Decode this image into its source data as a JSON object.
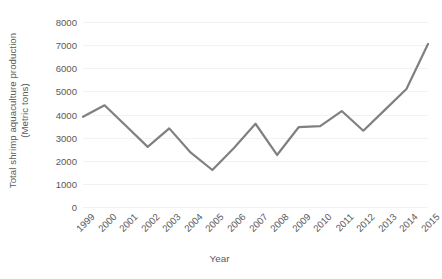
{
  "chart_data": {
    "type": "line",
    "title": "",
    "xlabel": "Year",
    "ylabel": "Total shrimp aquaculture production (Metric tons)",
    "ylabel_lines": [
      "Total shrimp aquaculture production",
      "(Metric tons)"
    ],
    "categories": [
      "1999",
      "2000",
      "2001",
      "2002",
      "2003",
      "2004",
      "2005",
      "2006",
      "2007",
      "2008",
      "2009",
      "2010",
      "2011",
      "2012",
      "2013",
      "2014",
      "2015"
    ],
    "x": [
      1999,
      2000,
      2001,
      2002,
      2003,
      2004,
      2005,
      2006,
      2007,
      2008,
      2009,
      2010,
      2011,
      2012,
      2013,
      2014,
      2015
    ],
    "values": [
      3900,
      4400,
      3500,
      2600,
      3400,
      2350,
      1600,
      2550,
      3600,
      2250,
      3450,
      3500,
      4150,
      3300,
      4200,
      5100,
      7050
    ],
    "series": [
      {
        "name": "Total shrimp aquaculture production",
        "values": [
          3900,
          4400,
          3500,
          2600,
          3400,
          2350,
          1600,
          2550,
          3600,
          2250,
          3450,
          3500,
          4150,
          3300,
          4200,
          5100,
          7050
        ],
        "color": "#808080"
      }
    ],
    "ylim": [
      0,
      8000
    ],
    "yticks": [
      0,
      1000,
      2000,
      3000,
      4000,
      5000,
      6000,
      7000,
      8000
    ],
    "ytick_labels": [
      "0",
      "1000",
      "2000",
      "3000",
      "4000",
      "5000",
      "6000",
      "7000",
      "8000"
    ],
    "grid": {
      "horizontal": true,
      "vertical": false,
      "color": "#f2f2f2"
    },
    "legend": {
      "visible": false,
      "position": "none"
    },
    "line_color": "#808080",
    "line_width": 2.2,
    "markers": false,
    "text_color": "#595959",
    "background": "#ffffff",
    "xtick_rotation": -45
  }
}
